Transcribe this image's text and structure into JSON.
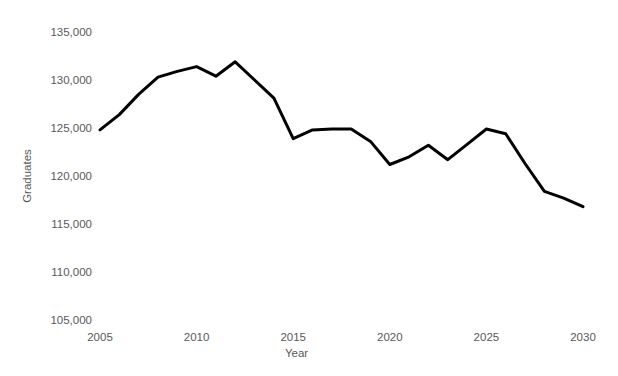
{
  "chart_data": {
    "type": "line",
    "title": "",
    "xlabel": "Year",
    "ylabel": "Graduates",
    "x": [
      2005,
      2006,
      2007,
      2008,
      2009,
      2010,
      2011,
      2012,
      2013,
      2014,
      2015,
      2016,
      2017,
      2018,
      2019,
      2020,
      2021,
      2022,
      2023,
      2024,
      2025,
      2026,
      2027,
      2028,
      2029,
      2030
    ],
    "series": [
      {
        "name": "Graduates",
        "values": [
          124800,
          126400,
          128500,
          130300,
          130900,
          131400,
          130400,
          131900,
          130000,
          128100,
          123900,
          124800,
          124900,
          124900,
          123600,
          121200,
          122000,
          123200,
          121700,
          123300,
          124900,
          124400,
          121300,
          118400,
          117700,
          116800
        ]
      }
    ],
    "xlim": [
      2005,
      2030
    ],
    "ylim": [
      105000,
      135000
    ],
    "xticks": [
      2005,
      2010,
      2015,
      2020,
      2025,
      2030
    ],
    "yticks": [
      105000,
      110000,
      115000,
      120000,
      125000,
      130000,
      135000
    ],
    "grid": false,
    "legend": "none",
    "line_color": "#000000",
    "line_width": 3,
    "label_color": "#595959",
    "background_color": "#ffffff"
  }
}
